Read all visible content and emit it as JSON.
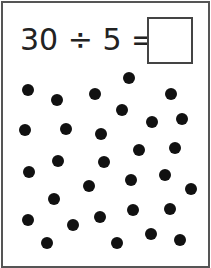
{
  "worksheet": {
    "equation": "30 ÷ 5 =",
    "dividend": 30,
    "divisor": 5,
    "answer": "",
    "dot_count": 30,
    "dots": [
      [
        28,
        90
      ],
      [
        57,
        100
      ],
      [
        95,
        94
      ],
      [
        129,
        78
      ],
      [
        171,
        94
      ],
      [
        122,
        110
      ],
      [
        152,
        122
      ],
      [
        182,
        119
      ],
      [
        25,
        130
      ],
      [
        66,
        129
      ],
      [
        101,
        134
      ],
      [
        139,
        150
      ],
      [
        175,
        148
      ],
      [
        29,
        172
      ],
      [
        58,
        161
      ],
      [
        104,
        162
      ],
      [
        89,
        186
      ],
      [
        131,
        180
      ],
      [
        165,
        175
      ],
      [
        191,
        189
      ],
      [
        54,
        199
      ],
      [
        28,
        220
      ],
      [
        73,
        225
      ],
      [
        100,
        217
      ],
      [
        133,
        210
      ],
      [
        170,
        209
      ],
      [
        47,
        243
      ],
      [
        117,
        243
      ],
      [
        151,
        234
      ],
      [
        180,
        240
      ]
    ]
  }
}
